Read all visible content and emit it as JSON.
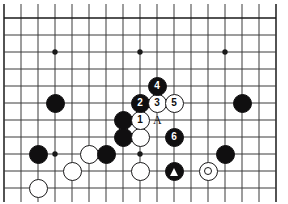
{
  "figure": {
    "board": {
      "background_color": "#ffffff",
      "line_color": "#3a3a3a",
      "edge_color": "#1a1a1a",
      "cell_size": 17,
      "origin_x": 4,
      "origin_y": 18,
      "cols": 17,
      "rows": 11,
      "star_points": [
        {
          "col": 3,
          "row": 2
        },
        {
          "col": 8,
          "row": 2
        },
        {
          "col": 13,
          "row": 2
        },
        {
          "col": 3,
          "row": 8
        },
        {
          "col": 8,
          "row": 8
        }
      ]
    },
    "stones": [
      {
        "color": "black",
        "col": 3,
        "row": 5,
        "label": "",
        "marker": "none",
        "size": 19
      },
      {
        "color": "black",
        "col": 2,
        "row": 8,
        "label": "",
        "marker": "none",
        "size": 19
      },
      {
        "color": "white",
        "col": 5,
        "row": 8,
        "label": "",
        "marker": "none",
        "size": 19
      },
      {
        "color": "black",
        "col": 6,
        "row": 8,
        "label": "",
        "marker": "none",
        "size": 19
      },
      {
        "color": "white",
        "col": 4,
        "row": 9,
        "label": "",
        "marker": "none",
        "size": 19
      },
      {
        "color": "white",
        "col": 2,
        "row": 10,
        "label": "",
        "marker": "none",
        "size": 19
      },
      {
        "color": "black",
        "col": 7,
        "row": 6,
        "label": "",
        "marker": "none",
        "size": 19
      },
      {
        "color": "black",
        "col": 7,
        "row": 7,
        "label": "",
        "marker": "none",
        "size": 19
      },
      {
        "color": "white",
        "col": 8,
        "row": 7,
        "label": "",
        "marker": "none",
        "size": 19
      },
      {
        "color": "white",
        "col": 8,
        "row": 9,
        "label": "",
        "marker": "none",
        "size": 19
      },
      {
        "color": "black",
        "col": 14,
        "row": 5,
        "label": "",
        "marker": "none",
        "size": 19
      },
      {
        "color": "black",
        "col": 13,
        "row": 8,
        "label": "",
        "marker": "none",
        "size": 19
      },
      {
        "color": "black",
        "col": 10,
        "row": 9,
        "label": "",
        "marker": "triangle",
        "size": 19
      },
      {
        "color": "white",
        "col": 12,
        "row": 9,
        "label": "",
        "marker": "circle",
        "size": 19
      },
      {
        "color": "white",
        "col": 8,
        "row": 6,
        "label": "1",
        "marker": "number",
        "size": 19
      },
      {
        "color": "black",
        "col": 8,
        "row": 5,
        "label": "2",
        "marker": "number",
        "size": 19
      },
      {
        "color": "white",
        "col": 9,
        "row": 5,
        "label": "3",
        "marker": "number",
        "size": 19
      },
      {
        "color": "black",
        "col": 9,
        "row": 4,
        "label": "4",
        "marker": "number",
        "size": 19
      },
      {
        "color": "white",
        "col": 10,
        "row": 5,
        "label": "5",
        "marker": "number",
        "size": 19
      },
      {
        "color": "black",
        "col": 10,
        "row": 7,
        "label": "6",
        "marker": "number",
        "size": 19
      }
    ],
    "point_labels": [
      {
        "text": "A",
        "col": 9,
        "row": 6
      }
    ]
  }
}
